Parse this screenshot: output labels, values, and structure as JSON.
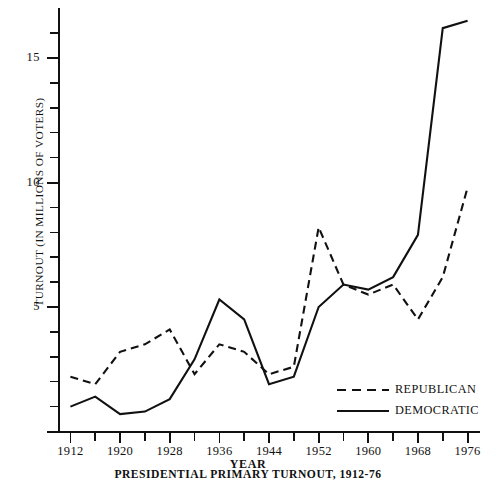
{
  "chart_data": {
    "type": "line",
    "title": "PRESIDENTIAL PRIMARY TURNOUT, 1912-76",
    "xlabel": "YEAR",
    "ylabel": "TURNOUT (IN MILLIONS OF VOTERS)",
    "x": [
      1912,
      1916,
      1920,
      1924,
      1928,
      1932,
      1936,
      1940,
      1944,
      1948,
      1952,
      1956,
      1960,
      1964,
      1968,
      1972,
      1976
    ],
    "xlim": [
      1910,
      1978
    ],
    "ylim": [
      0,
      17
    ],
    "xticks": [
      1912,
      1916,
      1920,
      1924,
      1928,
      1932,
      1936,
      1940,
      1944,
      1948,
      1952,
      1956,
      1960,
      1964,
      1968,
      1972,
      1976
    ],
    "xtick_labels": [
      "1912",
      "1920",
      "1928",
      "1936",
      "1944",
      "1952",
      "1960",
      "1968",
      "1976"
    ],
    "xtick_labeled_years": [
      1912,
      1920,
      1928,
      1936,
      1944,
      1952,
      1960,
      1968,
      1976
    ],
    "yticks": [
      0,
      1,
      2,
      3,
      4,
      5,
      6,
      7,
      8,
      9,
      10,
      11,
      12,
      13,
      14,
      15,
      16
    ],
    "ytick_labels": [
      "0",
      "5",
      "10",
      "15"
    ],
    "ytick_labeled_values": [
      0,
      5,
      10,
      15
    ],
    "grid": false,
    "legend_position": "lower right",
    "series": [
      {
        "name": "REPUBLICAN",
        "style": "dashed",
        "color": "#111111",
        "values": [
          2.2,
          1.9,
          3.2,
          3.5,
          4.1,
          2.3,
          3.5,
          3.2,
          2.3,
          2.6,
          8.2,
          5.9,
          5.5,
          5.9,
          4.5,
          6.2,
          9.8
        ]
      },
      {
        "name": "DEMOCRATIC",
        "style": "solid",
        "color": "#111111",
        "values": [
          1.0,
          1.4,
          0.7,
          0.8,
          1.3,
          2.9,
          5.3,
          4.5,
          1.9,
          2.2,
          5.0,
          5.9,
          5.7,
          6.2,
          7.9,
          16.2,
          16.5
        ]
      }
    ]
  },
  "axes": {
    "y_title": "TURNOUT (IN MILLIONS OF VOTERS)",
    "x_title": "YEAR"
  },
  "caption": {
    "text": "PRESIDENTIAL PRIMARY TURNOUT, 1912-76"
  },
  "legend": {
    "entries": [
      {
        "label": "REPUBLICAN",
        "style": "dashed"
      },
      {
        "label": "DEMOCRATIC",
        "style": "solid"
      }
    ]
  }
}
